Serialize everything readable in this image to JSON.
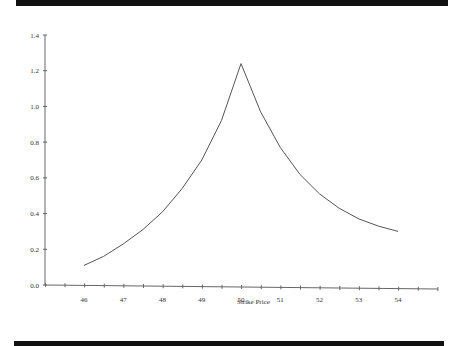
{
  "chart_data": {
    "type": "line",
    "title": "",
    "xlabel": "Strike Price",
    "ylabel": "",
    "x_tick_labels": [
      "46",
      "47",
      "48",
      "49",
      "50",
      "51",
      "52",
      "53",
      "54"
    ],
    "y_tick_labels": [
      "0.0",
      "0.2",
      "0.4",
      "0.6",
      "0.8",
      "1.0",
      "1.2",
      "1.4"
    ],
    "xlim": [
      44.5,
      55.5
    ],
    "ylim": [
      0,
      1.4
    ],
    "grid": false,
    "legend": null,
    "series": [
      {
        "name": "curve",
        "x": [
          46,
          46.5,
          47,
          47.5,
          48,
          48.5,
          49,
          49.5,
          50,
          50.5,
          51,
          51.5,
          52,
          52.5,
          53,
          53.5,
          54
        ],
        "y": [
          0.11,
          0.16,
          0.23,
          0.31,
          0.41,
          0.54,
          0.7,
          0.92,
          1.24,
          0.97,
          0.77,
          0.62,
          0.51,
          0.43,
          0.37,
          0.33,
          0.3
        ]
      }
    ]
  },
  "labels": {
    "xlabel": "Strike Price",
    "overlap_label": "50"
  },
  "colors": {
    "line": "#555555",
    "axis": "#666666",
    "bar": "#111111"
  }
}
